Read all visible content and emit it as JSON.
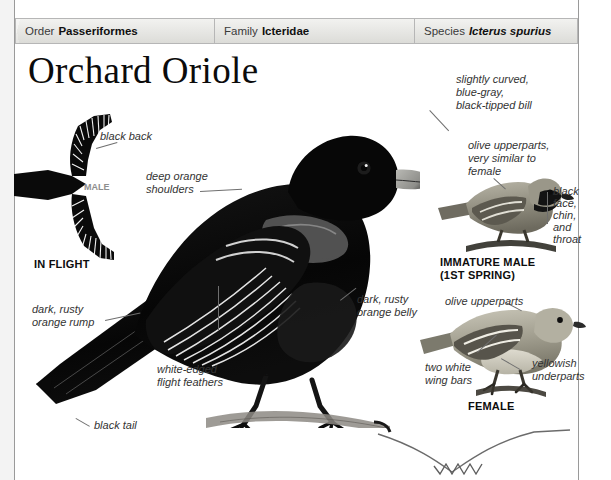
{
  "page": {
    "title": "Orchard Oriole"
  },
  "taxonomy": [
    {
      "key": "Order",
      "value": "Passeriformes",
      "italic": false
    },
    {
      "key": "Family",
      "value": "Icteridae",
      "italic": false
    },
    {
      "key": "Species",
      "value": "Icterus spurius",
      "italic": true
    }
  ],
  "annotations": {
    "black_back": "black back",
    "deep_orange_shoulders": "deep orange\nshoulders",
    "slightly_curved_bill": "slightly curved,\nblue-gray,\nblack-tipped bill",
    "olive_upperparts_similar": "olive upperparts,\nvery similar to\nfemale",
    "black_face_chin_throat": "black\nface,\nchin,\nand\nthroat",
    "dark_rusty_orange_rump": "dark, rusty\norange rump",
    "dark_rusty_orange_belly": "dark, rusty\norange belly",
    "white_edged_flight_feathers": "white-edged\nflight feathers",
    "black_tail": "black tail",
    "olive_upperparts": "olive upperparts",
    "two_white_wing_bars": "two white\nwing bars",
    "yellowish_underparts": "yellowish\nunderparts"
  },
  "captions": {
    "in_flight": "IN FLIGHT",
    "in_flight_male": "MALE",
    "male": "MALE",
    "immature_male": "IMMATURE MALE\n(1ST SPRING)",
    "female": "FEMALE"
  },
  "figures": {
    "in_flight_bird": "in-flight-male-silhouette",
    "male_bird": "perched-adult-male",
    "immature_male_bird": "perched-immature-male",
    "female_bird": "perched-female",
    "branch_sprig": "decorative-branch-sprig"
  },
  "colors": {
    "page_background": "#ffffff",
    "margin_strip": "#f3f3f3",
    "rule": "#9a9a9a",
    "header_border": "#b6b6b6",
    "header_fill": "#e6e6e3",
    "annotation_text": "#333333",
    "caption_text": "#0d0d0d",
    "leader_line": "#6f6f6f",
    "plumage_black": "#0a0a0a",
    "plumage_olive": "#8d8a7c",
    "plumage_pale": "#d8d5cb"
  }
}
